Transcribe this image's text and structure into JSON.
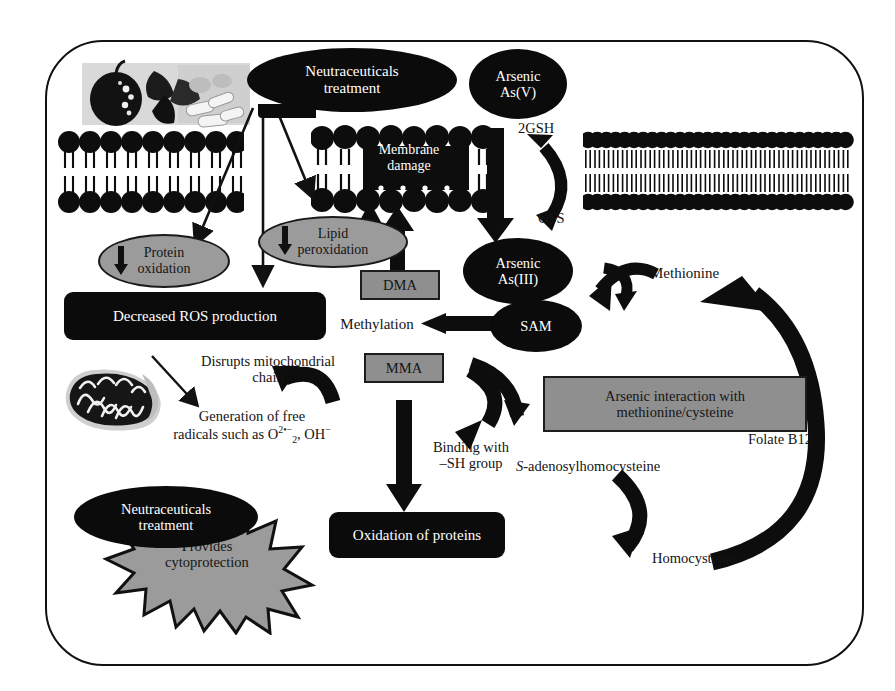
{
  "diagram": {
    "colors": {
      "black_node": "#0b0b0b",
      "gray_node": "#9b9b9b",
      "gray_box": "#8f8f8f",
      "outline": "#111111",
      "background": "#ffffff",
      "text_light": "#ffffff",
      "text_dark": "#141414"
    },
    "nodes": {
      "neutraceuticals_top": "Neutraceuticals\ntreatment",
      "neutraceuticals_top_line1": "Neutraceuticals",
      "neutraceuticals_top_line2": "treatment",
      "arsenic_v_line1": "Arsenic",
      "arsenic_v_line2": "As(V)",
      "membrane_damage_line1": "Membrane",
      "membrane_damage_line2": "damage",
      "gsh_label": "2GSH",
      "gss_label": "GSS",
      "arsenic_iii_line1": "Arsenic",
      "arsenic_iii_line2": "As(III)",
      "protein_oxidation_line1": "Protein",
      "protein_oxidation_line2": "oxidation",
      "lipid_peroxidation_line1": "Lipid",
      "lipid_peroxidation_line2": "peroxidation",
      "dma": "DMA",
      "mma": "MMA",
      "decreased_ros": "Decreased ROS production",
      "methylation": "Methylation",
      "sam": "SAM",
      "methionine": "Methionine",
      "disrupts_line1": "Disrupts mitochondrial",
      "disrupts_line2": "chain",
      "free_radicals_line1": "Generation of free",
      "free_radicals_line2_pre": "radicals such as O",
      "free_radicals_o2_sup": "2•−",
      "free_radicals_o2_sub": "2",
      "free_radicals_line2_post": ", OH",
      "free_radicals_oh_sup": "−",
      "arsenic_interaction_line1": "Arsenic interaction with",
      "arsenic_interaction_line2": "methionine/cysteine",
      "binding_line1": "Binding with",
      "binding_line2": "–SH group",
      "s_adenosyl_italic": "S",
      "s_adenosyl_rest": "-adenosylhomocysteine",
      "folate_b12": "Folate B12",
      "homocysteine": "Homocysteine",
      "oxidation_of_proteins": "Oxidation of proteins",
      "neutraceuticals_bottom_line1": "Neutraceuticals",
      "neutraceuticals_bottom_line2": "treatment",
      "provides_line1": "Provides",
      "provides_line2": "cytoprotection"
    },
    "images": {
      "food_supplements": "fruits-and-capsules-photo",
      "mitochondrion": "mitochondrion-photo"
    },
    "membranes": {
      "left_intact": "lipid-bilayer-left",
      "center_damaged": "lipid-bilayer-damaged",
      "right_intact": "lipid-bilayer-right"
    },
    "arrow_count": 16
  }
}
